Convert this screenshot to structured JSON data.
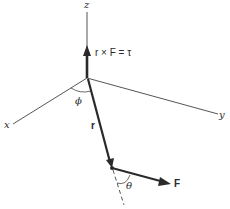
{
  "diagram": {
    "axes": {
      "x_label": "x",
      "y_label": "y",
      "z_label": "z"
    },
    "vectors": {
      "torque_label": "r × F = τ",
      "position_label": "r",
      "force_label": "F"
    },
    "angles": {
      "phi_label": "ϕ",
      "theta_label": "θ"
    },
    "colors": {
      "line": "#2a2a2a",
      "background": "#ffffff"
    }
  }
}
